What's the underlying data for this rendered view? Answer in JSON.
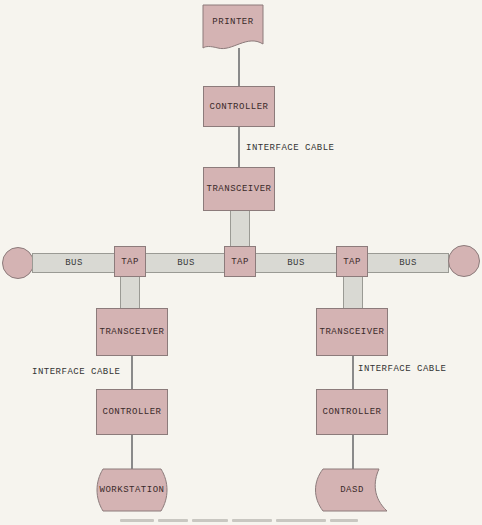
{
  "diagram": {
    "printer": {
      "label": "PRINTER"
    },
    "top_controller": {
      "label": "CONTROLLER"
    },
    "top_cable": {
      "label": "INTERFACE CABLE"
    },
    "top_transceiver": {
      "label": "TRANSCEIVER"
    },
    "bus_segments": [
      {
        "label": "BUS"
      },
      {
        "label": "BUS"
      },
      {
        "label": "BUS"
      },
      {
        "label": "BUS"
      }
    ],
    "taps": [
      {
        "label": "TAP"
      },
      {
        "label": "TAP"
      },
      {
        "label": "TAP"
      }
    ],
    "left_branch": {
      "transceiver": "TRANSCEIVER",
      "cable": "INTERFACE CABLE",
      "controller": "CONTROLLER",
      "device": "WORKSTATION"
    },
    "right_branch": {
      "transceiver": "TRANSCEIVER",
      "cable": "INTERFACE CABLE",
      "controller": "CONTROLLER",
      "device": "DASD"
    },
    "colors": {
      "node_fill": "#d4b3b3",
      "bus_fill": "#d9d9d3",
      "background": "#f6f4ee"
    }
  }
}
